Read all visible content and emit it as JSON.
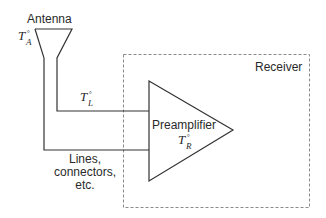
{
  "diagram": {
    "type": "block-diagram",
    "antenna": {
      "label": "Antenna",
      "temperature": {
        "symbol": "T",
        "superscript": "°",
        "subscript": "A"
      }
    },
    "line": {
      "temperature": {
        "symbol": "T",
        "superscript": "°",
        "subscript": "L"
      },
      "caption_lines": [
        "Lines,",
        "connectors,",
        "etc."
      ]
    },
    "receiver": {
      "label": "Receiver",
      "border_style": "dashed"
    },
    "preamplifier": {
      "label": "Preamplifier",
      "temperature": {
        "symbol": "T",
        "superscript": "°",
        "subscript": "R"
      }
    },
    "colors": {
      "stroke": "#333333",
      "dashed_border": "#8a8a8a",
      "text": "#2a2a2a",
      "background": "#ffffff"
    }
  }
}
